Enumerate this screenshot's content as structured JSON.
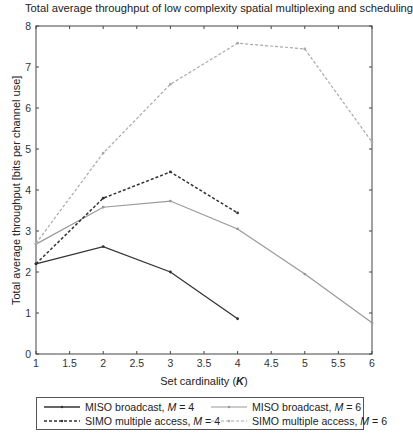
{
  "chart_data": {
    "type": "line",
    "title": "Total average throughput of low complexity spatial multiplexing and scheduling",
    "xlabel": "Set cardinality (K)",
    "xlabel_prefix": "Set cardinality (",
    "xlabel_var": "K",
    "xlabel_suffix": ")",
    "ylabel": "Total average throughput [bits per channel use]",
    "xlim": [
      1,
      6
    ],
    "ylim": [
      0,
      8
    ],
    "xticks": [
      1,
      1.5,
      2,
      2.5,
      3,
      3.5,
      4,
      4.5,
      5,
      5.5,
      6
    ],
    "xtick_labels": [
      "1",
      "1.5",
      "2",
      "2.5",
      "3",
      "3.5",
      "4",
      "4.5",
      "5",
      "5.5",
      "6"
    ],
    "yticks": [
      0,
      1,
      2,
      3,
      4,
      5,
      6,
      7,
      8
    ],
    "ytick_labels": [
      "0",
      "1",
      "2",
      "3",
      "4",
      "5",
      "6",
      "7",
      "8"
    ],
    "grid": false,
    "legend_position": "below",
    "series": [
      {
        "name": "MISO broadcast, M = 4",
        "label_text": "MISO broadcast, ",
        "label_var": "M",
        "label_value": " = 4",
        "x": [
          1,
          2,
          3,
          4
        ],
        "values": [
          2.2,
          2.62,
          2.0,
          0.86
        ],
        "color": "#333333",
        "dash": "",
        "width": 1.3
      },
      {
        "name": "MISO broadcast, M = 6",
        "label_text": "MISO broadcast, ",
        "label_var": "M",
        "label_value": " = 6",
        "x": [
          1,
          2,
          3,
          4,
          5,
          6
        ],
        "values": [
          2.68,
          3.58,
          3.73,
          3.05,
          1.95,
          0.76
        ],
        "color": "#999999",
        "dash": "",
        "width": 1.2
      },
      {
        "name": "SIMO multiple access, M = 4",
        "label_text": "SIMO multiple access, ",
        "label_var": "M",
        "label_value": " = 4",
        "x": [
          1,
          2,
          3,
          4
        ],
        "values": [
          2.2,
          3.8,
          4.44,
          3.44
        ],
        "color": "#333333",
        "dash": "3,2",
        "width": 1.5
      },
      {
        "name": "SIMO multiple access, M = 6",
        "label_text": "SIMO multiple access, ",
        "label_var": "M",
        "label_value": " = 6",
        "x": [
          1,
          2,
          3,
          4,
          5,
          6
        ],
        "values": [
          2.7,
          4.9,
          6.58,
          7.58,
          7.44,
          5.17
        ],
        "color": "#aaaaaa",
        "dash": "3,2",
        "width": 1.2
      }
    ]
  }
}
